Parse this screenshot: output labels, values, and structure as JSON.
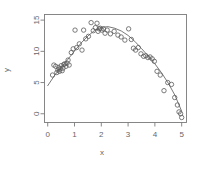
{
  "chart_data": {
    "type": "scatter",
    "title": "",
    "subtitle": "",
    "xlabel": "x",
    "ylabel": "y",
    "xlim": [
      -0.12,
      5.18
    ],
    "ylim": [
      -1.4,
      15.9
    ],
    "xticks": [
      0,
      1,
      2,
      3,
      4,
      5
    ],
    "xticklabels": [
      "0",
      "1",
      "2",
      "3",
      "4",
      "5"
    ],
    "yticks": [
      0,
      5,
      10,
      15
    ],
    "yticklabels": [
      "0",
      "5",
      "10",
      "15"
    ],
    "grid": false,
    "legend": null,
    "legend_position": "none",
    "point_marker": "open-circle",
    "point_color": "#5a5a5a",
    "point_radius": 2.2,
    "line_color": "#6a6a6a",
    "frame_color": "#7a7a7a",
    "background": "#ffffff",
    "series": [
      {
        "name": "observations",
        "type": "scatter",
        "x": [
          0.18,
          0.23,
          0.3,
          0.34,
          0.38,
          0.41,
          0.44,
          0.47,
          0.5,
          0.54,
          0.57,
          0.6,
          0.64,
          0.68,
          0.72,
          0.76,
          0.8,
          0.88,
          0.95,
          1.02,
          1.08,
          1.18,
          1.28,
          1.34,
          1.42,
          1.52,
          1.62,
          1.7,
          1.78,
          1.84,
          1.88,
          1.92,
          1.96,
          2.02,
          2.08,
          2.14,
          2.22,
          2.34,
          2.48,
          2.62,
          2.74,
          2.88,
          3.02,
          3.12,
          3.2,
          3.28,
          3.38,
          3.48,
          3.58,
          3.66,
          3.74,
          3.82,
          3.9,
          3.98,
          4.08,
          4.2,
          4.34,
          4.48,
          4.62,
          4.74,
          4.84,
          4.9,
          4.96,
          5.0
        ],
        "y": [
          6.2,
          7.8,
          7.6,
          6.6,
          7.0,
          7.4,
          6.8,
          7.2,
          7.7,
          6.9,
          7.3,
          7.9,
          8.0,
          7.6,
          8.1,
          8.6,
          7.8,
          9.8,
          10.4,
          13.4,
          10.6,
          11.2,
          10.2,
          13.4,
          12.0,
          12.4,
          14.6,
          13.3,
          13.8,
          14.5,
          13.2,
          13.6,
          13.7,
          13.4,
          13.6,
          12.9,
          13.4,
          12.8,
          13.2,
          12.6,
          12.3,
          11.8,
          13.6,
          11.9,
          10.5,
          10.2,
          10.6,
          9.6,
          9.2,
          9.3,
          9.0,
          9.1,
          8.8,
          8.4,
          6.8,
          6.2,
          3.7,
          5.0,
          4.7,
          2.6,
          1.4,
          0.3,
          0.0,
          -0.6
        ]
      },
      {
        "name": "fitted-curve",
        "type": "line",
        "x": [
          0.0,
          0.25,
          0.5,
          0.75,
          1.0,
          1.25,
          1.5,
          1.75,
          2.0,
          2.25,
          2.5,
          2.75,
          3.0,
          3.25,
          3.5,
          3.75,
          4.0,
          4.25,
          4.5,
          4.75,
          5.0
        ],
        "y": [
          4.5,
          6.1,
          7.45,
          8.7,
          10.05,
          11.35,
          12.45,
          13.35,
          13.85,
          13.95,
          13.7,
          13.25,
          12.55,
          11.6,
          10.45,
          9.25,
          8.0,
          6.55,
          4.9,
          2.95,
          0.4
        ]
      }
    ]
  }
}
